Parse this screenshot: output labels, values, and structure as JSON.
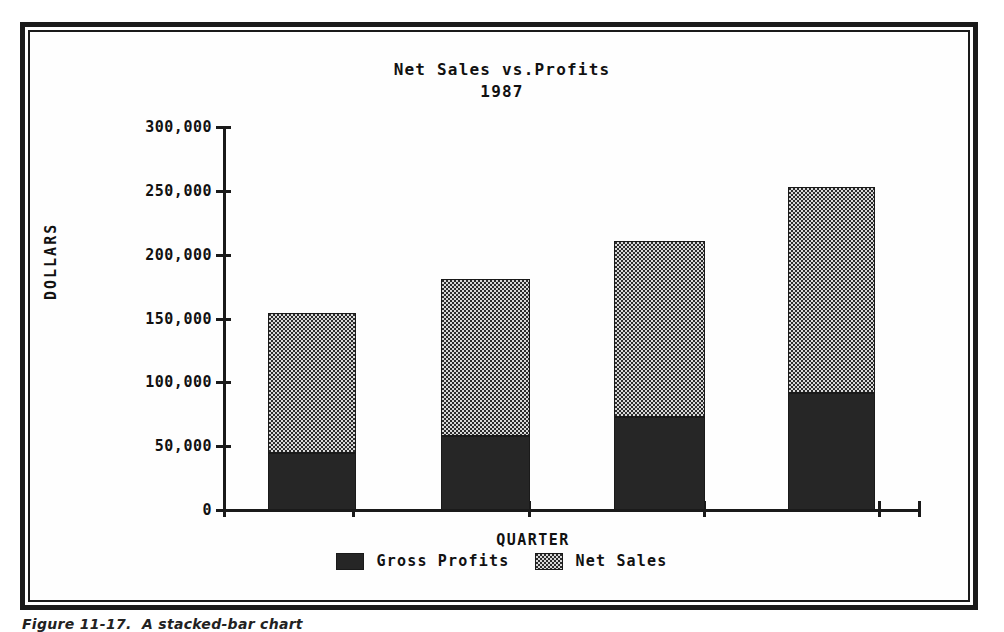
{
  "figure": {
    "caption": "Figure 11-17.  A stacked-bar chart"
  },
  "chart_data": {
    "type": "bar",
    "subtype": "stacked",
    "title": "Net Sales vs.Profits",
    "subtitle": "1987",
    "xlabel": "QUARTER",
    "ylabel": "DOLLARS",
    "categories": [
      "Q1",
      "Q2",
      "Q3",
      "Q4"
    ],
    "ylim": [
      0,
      300000
    ],
    "yticks": [
      0,
      50000,
      100000,
      150000,
      200000,
      250000,
      300000
    ],
    "ytick_labels": [
      "0",
      "50,000",
      "100,000",
      "150,000",
      "200,000",
      "250,000",
      "300,000"
    ],
    "grid": false,
    "legend_position": "bottom",
    "series": [
      {
        "name": "Gross Profits",
        "fill": "solid",
        "color": "#262626",
        "values": [
          45000,
          58000,
          73000,
          92000
        ]
      },
      {
        "name": "Net Sales",
        "fill": "checker",
        "color": "#2b2b2b",
        "values": [
          109000,
          123000,
          138000,
          161000
        ]
      }
    ],
    "stack_totals": [
      154000,
      181000,
      211000,
      253000
    ]
  }
}
